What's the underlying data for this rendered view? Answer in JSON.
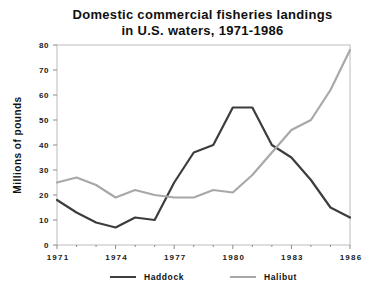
{
  "title": {
    "line1": "Domestic commercial fisheries landings",
    "line2": "in U.S. waters, 1971-1986"
  },
  "chart_data": {
    "type": "line",
    "x": [
      1971,
      1972,
      1973,
      1974,
      1975,
      1976,
      1977,
      1978,
      1979,
      1980,
      1981,
      1982,
      1983,
      1984,
      1985,
      1986
    ],
    "series": [
      {
        "name": "Haddock",
        "color": "#3d3d3d",
        "values": [
          18,
          13,
          9,
          7,
          11,
          10,
          25,
          37,
          40,
          55,
          55,
          40,
          35,
          26,
          15,
          11
        ]
      },
      {
        "name": "Halibut",
        "color": "#a8a8a8",
        "values": [
          25,
          27,
          24,
          19,
          22,
          20,
          19,
          19,
          22,
          21,
          28,
          37,
          46,
          50,
          62,
          78
        ]
      }
    ],
    "xlabel": "",
    "ylabel": "Millions of pounds",
    "ylim": [
      0,
      80
    ],
    "y_ticks": [
      0,
      10,
      20,
      30,
      40,
      50,
      60,
      70,
      80
    ],
    "x_tick_labels": [
      1971,
      1974,
      1977,
      1980,
      1983,
      1986
    ],
    "grid": false,
    "legend_position": "bottom",
    "axis_box_color": "#bcbcbc",
    "tick_color": "#8a8a8a"
  },
  "legend": {
    "items": [
      {
        "label": "Haddock"
      },
      {
        "label": "Halibut"
      }
    ]
  }
}
